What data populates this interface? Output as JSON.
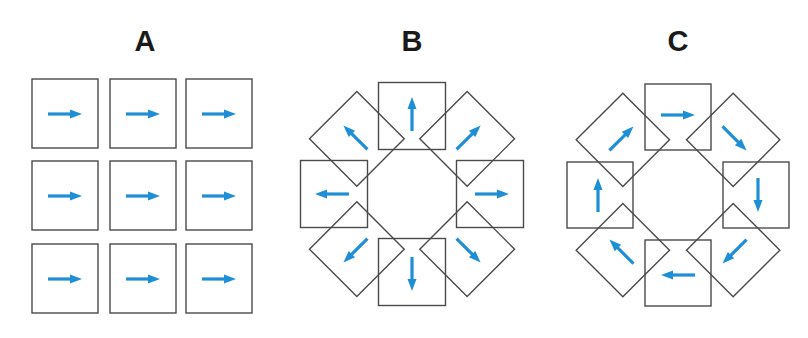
{
  "colors": {
    "arrow": "#1e8fd6",
    "square_stroke": "#4a4a4a",
    "title": "#1a1a1a"
  },
  "panels": [
    {
      "id": "A",
      "title": "A",
      "layout": "grid-3x3",
      "title_x": 145,
      "cells": [
        {
          "x": 32,
          "y": 79,
          "dir": 0
        },
        {
          "x": 110,
          "y": 79,
          "dir": 0
        },
        {
          "x": 186,
          "y": 79,
          "dir": 0
        },
        {
          "x": 32,
          "y": 161,
          "dir": 0
        },
        {
          "x": 110,
          "y": 161,
          "dir": 0
        },
        {
          "x": 186,
          "y": 161,
          "dir": 0
        },
        {
          "x": 32,
          "y": 244,
          "dir": 0
        },
        {
          "x": 110,
          "y": 244,
          "dir": 0
        },
        {
          "x": 186,
          "y": 244,
          "dir": 0
        }
      ],
      "size": 66,
      "description": "All nine arrows point right (uniform translation)"
    },
    {
      "id": "B",
      "title": "B",
      "layout": "ring-8",
      "title_x": 412,
      "center": [
        412,
        194
      ],
      "radius": 78,
      "size": 67,
      "arrow_mode": "radial-outward",
      "description": "Arrows point outward from center (expansion)"
    },
    {
      "id": "C",
      "title": "C",
      "layout": "ring-8",
      "title_x": 678,
      "center": [
        678,
        195
      ],
      "radius": 78,
      "size": 66,
      "arrow_mode": "tangential-clockwise",
      "description": "Arrows circulate clockwise (rotation)"
    }
  ]
}
